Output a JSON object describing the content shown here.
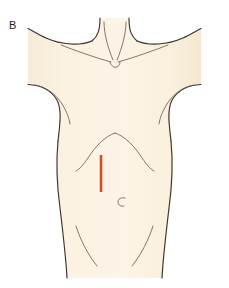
{
  "figure": {
    "panel_label": "B",
    "caption_text": "",
    "type": "anatomical-illustration",
    "view": "frontal"
  },
  "colors": {
    "background": "#ffffff",
    "skin_fill": "#faf0df",
    "skin_fill_shadow": "#f6e9d4",
    "outline": "#3a342c",
    "detail_line": "#6b6154",
    "incision_red": "#d94a28",
    "label_text": "#1c1c1c"
  },
  "annotations": {
    "incision": {
      "name": "surgical-incision-marking",
      "description": "vertical right paramedian incision line",
      "color": "#d94a28",
      "x": 101,
      "y_top": 155,
      "y_bottom": 192,
      "length_px": 37,
      "stroke_width": 2.6
    }
  },
  "landmarks": [
    {
      "name": "suprasternal-notch",
      "x": 115,
      "y": 62
    },
    {
      "name": "clavicle-left",
      "x": 78,
      "y": 52
    },
    {
      "name": "clavicle-right",
      "x": 152,
      "y": 52
    },
    {
      "name": "costal-margin-apex",
      "x": 115,
      "y": 133
    },
    {
      "name": "umbilicus",
      "x": 122,
      "y": 202
    },
    {
      "name": "inguinal-crease-left",
      "x": 83,
      "y": 245
    },
    {
      "name": "inguinal-crease-right",
      "x": 147,
      "y": 245
    }
  ],
  "geometry": {
    "figure_bounds": {
      "x": 28,
      "y": 18,
      "width": 173,
      "height": 260
    },
    "shoulder_left_x": 28,
    "shoulder_right_x": 201,
    "neck_left_x": 100,
    "neck_right_x": 130,
    "waist_left_x": 60,
    "waist_right_x": 170,
    "bottom_y": 278
  }
}
